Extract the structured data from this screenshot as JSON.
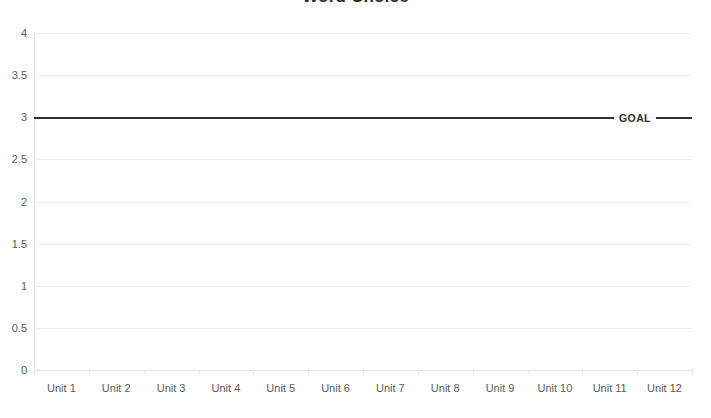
{
  "chart_data": {
    "type": "line",
    "title": "Word Choice",
    "xlabel": "",
    "ylabel": "",
    "ylim": [
      0,
      4
    ],
    "yticks": [
      0,
      0.5,
      1,
      1.5,
      2,
      2.5,
      3,
      3.5,
      4
    ],
    "ytick_labels": [
      "0",
      "0.5",
      "1",
      "1.5",
      "2",
      "2.5",
      "3",
      "3.5",
      "4"
    ],
    "grid": true,
    "legend": "none",
    "categories": [
      "Unit 1",
      "Unit 2",
      "Unit 3",
      "Unit 4",
      "Unit 5",
      "Unit 6",
      "Unit 7",
      "Unit 8",
      "Unit 9",
      "Unit 10",
      "Unit 11",
      "Unit 12"
    ],
    "series": [
      {
        "name": "GOAL",
        "type": "threshold-line",
        "value": 3,
        "values": [
          3,
          3,
          3,
          3,
          3,
          3,
          3,
          3,
          3,
          3,
          3,
          3
        ],
        "label": "GOAL",
        "color": "#2f2f2f"
      }
    ],
    "annotations": [
      {
        "text": "GOAL",
        "y": 3,
        "position": "right-inline"
      }
    ],
    "colors": {
      "goal_line": "#2f2f2f",
      "gridline": "#ececec",
      "axis": "#e0e0e0",
      "tick_text": "#595959",
      "title_text": "#2b2b2b",
      "background": "#ffffff"
    }
  }
}
